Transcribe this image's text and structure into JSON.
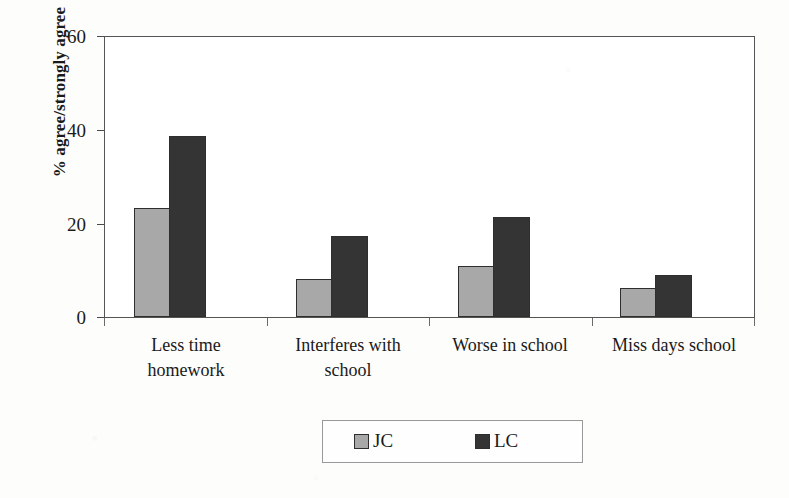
{
  "chart_data": {
    "type": "bar",
    "title": "",
    "xlabel": "",
    "ylabel": "% agree/strongly agree",
    "ylim": [
      0,
      60
    ],
    "yticks": [
      0,
      20,
      40,
      60
    ],
    "ytick_labels": [
      "0",
      "20",
      "40",
      "60"
    ],
    "grid": false,
    "legend_position": "bottom-center",
    "categories": [
      "Less time\nhomework",
      "Interferes with\nschool",
      "Worse in school",
      "Miss days school"
    ],
    "series": [
      {
        "name": "JC",
        "color": "#a8a8a8",
        "values": [
          23.5,
          8.2,
          10.9,
          6.2
        ]
      },
      {
        "name": "LC",
        "color": "#343434",
        "values": [
          39.0,
          17.4,
          21.5,
          9.1
        ]
      }
    ]
  },
  "legend": {
    "entries": [
      {
        "label": "JC",
        "swatch": "legend-swatch-jc"
      },
      {
        "label": "LC",
        "swatch": "legend-swatch-lc"
      }
    ]
  }
}
